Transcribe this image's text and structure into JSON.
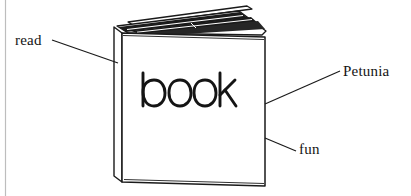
{
  "figure": {
    "type": "hand-drawn line illustration",
    "background_color": "#ffffff",
    "ink_color": "#1a1a1a",
    "page_edge_line_color": "#b9b9b9"
  },
  "cover_text": {
    "word": "book",
    "style": "handwritten marker"
  },
  "annotations": [
    {
      "id": "read",
      "label": "read",
      "side": "left",
      "points_to": "spine / left edge of book",
      "leader_line": {
        "x1": 52,
        "y1": 40,
        "x2": 118,
        "y2": 63
      },
      "label_position": {
        "x": 15,
        "y": 33
      }
    },
    {
      "id": "petunia",
      "label": "Petunia",
      "side": "right",
      "points_to": "right edge of front cover",
      "leader_line": {
        "x1": 340,
        "y1": 71,
        "x2": 265,
        "y2": 104
      },
      "label_position": {
        "x": 343,
        "y": 64
      }
    },
    {
      "id": "fun",
      "label": "fun",
      "side": "right",
      "points_to": "lower right edge of front cover",
      "leader_line": {
        "x1": 296,
        "y1": 151,
        "x2": 265,
        "y2": 138
      },
      "label_position": {
        "x": 299,
        "y": 142
      }
    }
  ],
  "page_artifact": {
    "description": "faint vertical scan line at left margin",
    "x": 5
  }
}
